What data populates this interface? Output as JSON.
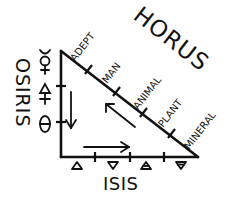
{
  "diagram": {
    "ink_color": "#111111",
    "background": "#ffffff",
    "labels": {
      "horus": "HORUS",
      "osiris": "OSIRIS",
      "isis": "ISIS"
    },
    "hypotenuse_stages": [
      "ADEPT",
      "MAN",
      "ANIMAL",
      "PLANT",
      "MINERAL"
    ],
    "left_side_symbols": [
      {
        "name": "mercury-symbol",
        "glyph": "☿"
      },
      {
        "name": "sulfur-symbol",
        "glyph": "🜍"
      },
      {
        "name": "salt-symbol",
        "glyph": "θ"
      }
    ],
    "bottom_side_symbols": [
      {
        "name": "fire-symbol",
        "glyph": "△"
      },
      {
        "name": "water-symbol",
        "glyph": "▽"
      },
      {
        "name": "air-symbol",
        "glyph": "🜁"
      },
      {
        "name": "earth-symbol",
        "glyph": "🜃"
      }
    ],
    "arrows": [
      {
        "name": "arrow-down",
        "direction": "down"
      },
      {
        "name": "arrow-right",
        "direction": "right"
      },
      {
        "name": "arrow-up-left",
        "direction": "up-left"
      }
    ]
  }
}
